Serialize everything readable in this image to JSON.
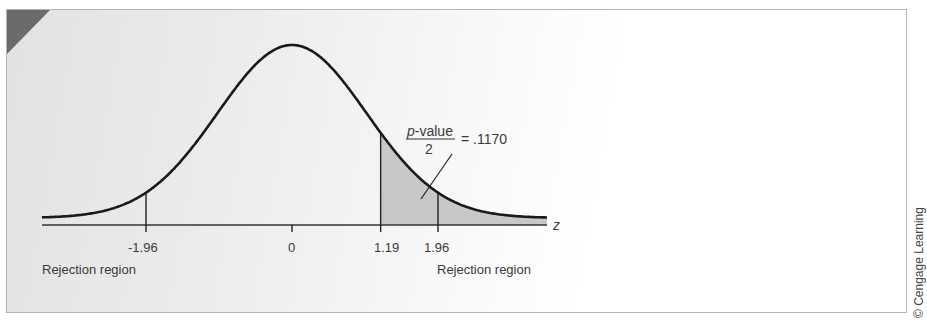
{
  "figure": {
    "copyright": "© Cengage Learning",
    "annotation": {
      "numerator": "p-value",
      "numerator_italic": "p",
      "numerator_rest": "-value",
      "denominator": "2",
      "equals": "= .1170"
    },
    "axis_label": "z",
    "left_region_label": "Rejection region",
    "right_region_label": "Rejection region",
    "colors": {
      "curve": "#1a1a1a",
      "shade": "#c8c8c8",
      "corner_triangle": "#6b6b6b",
      "frame_border": "#b5b5b5"
    }
  },
  "chart_data": {
    "type": "area",
    "title": "",
    "xlabel": "z",
    "ylabel": "",
    "distribution": "standard normal",
    "tick_labels": [
      "-1.96",
      "0",
      "1.19",
      "1.96"
    ],
    "ticks": [
      -1.96,
      0,
      1.19,
      1.96
    ],
    "critical_values": [
      -1.96,
      1.96
    ],
    "test_statistic": 1.19,
    "shaded_region": {
      "from": 1.19,
      "to": "+inf",
      "area": 0.117
    },
    "annotation": "p-value / 2 = .1170",
    "regions": [
      {
        "label": "Rejection region",
        "side": "left",
        "boundary": -1.96
      },
      {
        "label": "Rejection region",
        "side": "right",
        "boundary": 1.96
      }
    ],
    "grid": false
  }
}
